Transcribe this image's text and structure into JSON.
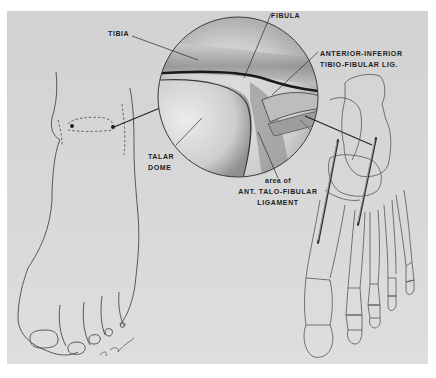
{
  "figure": {
    "style": "grayscale pencil illustration",
    "colors": {
      "page_background": "#ffffff",
      "panel_background": "#d6d6d6",
      "line": "#3a3a3a",
      "label_text": "#1e1e1e"
    }
  },
  "labels": {
    "tibia": "TIBIA",
    "fibula": "FIBULA",
    "aitfl_line1": "ANTERIOR-INFERIOR",
    "aitfl_line2": "TIBIO-FIBULAR  LIG.",
    "talar_line1": "TALAR",
    "talar_line2": "DOME",
    "atfl_line1": "area of",
    "atfl_line2": "ANT.  TALO-FIBULAR",
    "atfl_line3": "LIGAMENT"
  },
  "panels": {
    "left": "Foot outline with ankle joint portal markers",
    "center": "Magnified circular arthroscopic view",
    "right": "Foot skeleton with two arthroscopic instruments"
  },
  "signature": "artist signature"
}
